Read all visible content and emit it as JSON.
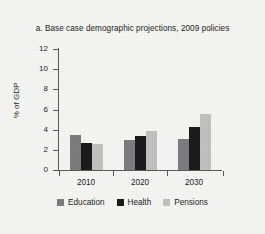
{
  "chart_data": {
    "type": "bar",
    "title": "a. Base case demographic projections, 2009 policies",
    "xlabel": "",
    "ylabel": "% of GDP",
    "categories": [
      "2010",
      "2020",
      "2030"
    ],
    "series": [
      {
        "name": "Education",
        "color": "#7c7c7e",
        "values": [
          3.5,
          3.0,
          3.05
        ]
      },
      {
        "name": "Health",
        "color": "#1b1b1b",
        "values": [
          2.65,
          3.4,
          4.25
        ]
      },
      {
        "name": "Pensions",
        "color": "#c0c0c0",
        "values": [
          2.6,
          3.9,
          5.6
        ]
      }
    ],
    "ylim": [
      0,
      12
    ],
    "yticks": [
      0,
      2,
      4,
      6,
      8,
      10,
      12
    ],
    "ytick_labels": [
      "0",
      "2",
      "4",
      "6",
      "8",
      "10",
      "12"
    ],
    "grid": false,
    "legend_position": "bottom"
  },
  "colors": {
    "background": "#f4f4f2",
    "axis": "#58585a",
    "text": "#231f20"
  }
}
